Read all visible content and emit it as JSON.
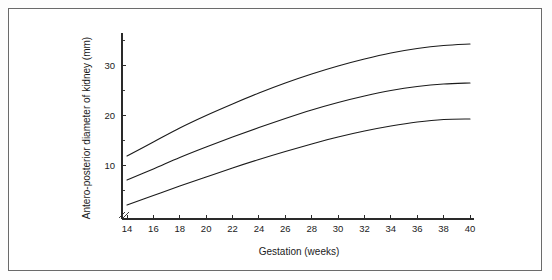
{
  "figure": {
    "background_color": "#ffffff",
    "frame_color": "#6a6a6a",
    "line_color": "#1b1b1b"
  },
  "chart_data": {
    "type": "line",
    "title": "",
    "subtitle": "",
    "xlabel": "Gestation (weeks)",
    "ylabel": "Antero-posterior diameter of kidney (mm)",
    "xlim": [
      14,
      40
    ],
    "ylim": [
      0,
      35
    ],
    "xticks": [
      14,
      16,
      18,
      20,
      22,
      24,
      26,
      28,
      30,
      32,
      34,
      36,
      38,
      40
    ],
    "xticklabels": [
      "14",
      "16",
      "18",
      "20",
      "22",
      "24",
      "26",
      "28",
      "30",
      "32",
      "34",
      "36",
      "38",
      "40"
    ],
    "yticks": [
      10,
      20,
      30
    ],
    "yticklabels": [
      "10",
      "20",
      "30"
    ],
    "yminorticks": [
      5,
      15,
      25,
      35
    ],
    "grid": false,
    "legend": false,
    "legend_position": "none",
    "x": [
      14,
      16,
      18,
      20,
      22,
      24,
      26,
      28,
      30,
      32,
      34,
      36,
      38,
      40
    ],
    "series": [
      {
        "name": "upper centile",
        "values": [
          11.8,
          14.6,
          17.4,
          19.9,
          22.2,
          24.4,
          26.4,
          28.2,
          29.8,
          31.2,
          32.4,
          33.3,
          33.9,
          34.2
        ]
      },
      {
        "name": "median",
        "values": [
          7.0,
          9.2,
          11.5,
          13.6,
          15.6,
          17.5,
          19.3,
          21.0,
          22.5,
          23.8,
          24.9,
          25.7,
          26.2,
          26.4
        ]
      },
      {
        "name": "lower centile",
        "values": [
          2.0,
          3.9,
          5.8,
          7.6,
          9.4,
          11.1,
          12.7,
          14.2,
          15.6,
          16.8,
          17.8,
          18.6,
          19.1,
          19.2
        ]
      }
    ]
  }
}
